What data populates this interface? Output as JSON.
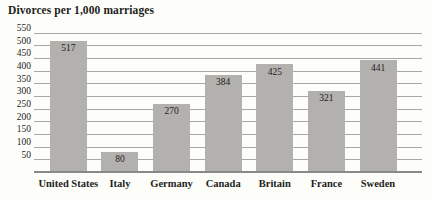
{
  "chart_data": {
    "type": "bar",
    "title": "Divorces per 1,000 marriages",
    "categories": [
      "United States",
      "Italy",
      "Germany",
      "Canada",
      "Britain",
      "France",
      "Sweden"
    ],
    "values": [
      517,
      80,
      270,
      384,
      425,
      321,
      441
    ],
    "xlabel": "",
    "ylabel": "Divorces per 1,000 marriages",
    "ylim": [
      0,
      550
    ],
    "yticks": [
      550,
      500,
      450,
      400,
      350,
      300,
      250,
      200,
      150,
      100,
      50
    ],
    "grid": true,
    "legend_position": "none",
    "value_labels": "inside-top",
    "colors": {
      "bar_fill": "#b3b1ad",
      "gridline": "#a9a7a2",
      "baseline": "#8b8985",
      "text": "#1e1d1a",
      "background": "#fdfdfa"
    }
  }
}
